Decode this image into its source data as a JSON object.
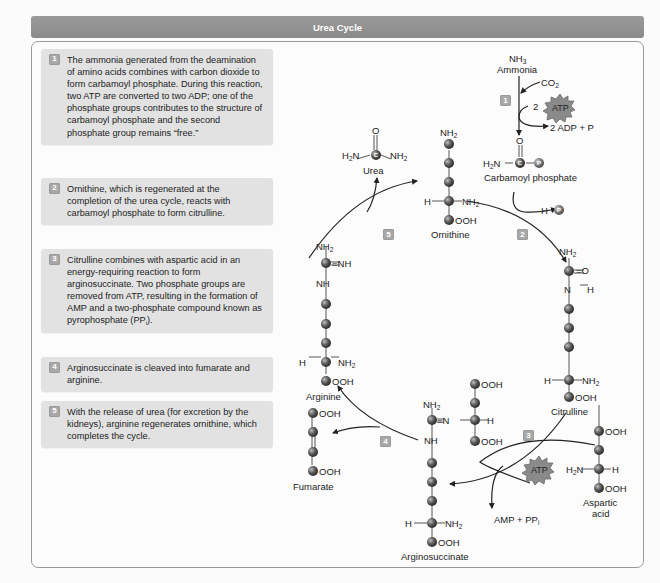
{
  "title": "Urea Cycle",
  "steps": [
    {
      "num": "1",
      "text": "The ammonia generated from the deamination of amino acids combines with carbon dioxide to form carbamoyl phosphate. During this reaction, two ATP are converted to two ADP; one of the phosphate groups contributes to the structure of carbamoyl phosphate and the second phosphate group remains “free.”"
    },
    {
      "num": "2",
      "text": "Ornithine, which is regenerated at the completion of the urea cycle, reacts with carbamoyl phosphate to form citrulline."
    },
    {
      "num": "3",
      "text_main": "Citrulline combines with aspartic acid in an energy-requiring reaction to form arginosuccinate. Two phosphate groups are removed from ATP, resulting in the formation of AMP and a two-phosphate compound known as pyrophosphate (PP",
      "text_sub": "i",
      "text_end": ")."
    },
    {
      "num": "4",
      "text": "Arginosuccinate is cleaved into fumarate and arginine."
    },
    {
      "num": "5",
      "text": "With the release of urea (for excretion by the kidneys), arginine regenerates ornithine, which completes the cycle."
    }
  ],
  "diagram": {
    "molecules": {
      "ammonia": {
        "formula": "NH",
        "formula_sub": "3",
        "name": "Ammonia"
      },
      "co2": {
        "formula": "CO",
        "formula_sub": "2"
      },
      "atp_label": "ATP",
      "atp_coefficient": "2",
      "adp_products": "2 ADP + P",
      "carbamoyl_phosphate": "Carbamoyl phosphate",
      "hydrogen_phosphate": "H",
      "urea": "Urea",
      "ornithine": "Ornithine",
      "citrulline": "Citrulline",
      "aspartic_acid_line1": "Aspartic",
      "aspartic_acid_line2": "acid",
      "arginosuccinate": "Arginosuccinate",
      "amp_products": "AMP + PP",
      "amp_products_sub": "i",
      "fumarate": "Fumarate",
      "arginine": "Arginine"
    },
    "atom_symbols": {
      "carbon": "C",
      "phosphate": "P",
      "oxygen": "O",
      "nh2": "NH",
      "nh2_sub": "2",
      "h2n": "H",
      "h2n_sub": "2",
      "h2n_end": "N",
      "nh": "NH",
      "h": "H",
      "ooh": "OOH",
      "n": "N",
      "eq_nh": "=NH",
      "eq_o": "=O",
      "eq_n": "=N"
    },
    "step_badges": [
      "1",
      "2",
      "3",
      "4",
      "5"
    ]
  },
  "colors": {
    "title_bar": "#8f8f8f",
    "step_box": "#e2e2e2",
    "badge": "#a8a8a8",
    "carbon_atom": "#555555",
    "atp_star": "#8a8a8a"
  }
}
